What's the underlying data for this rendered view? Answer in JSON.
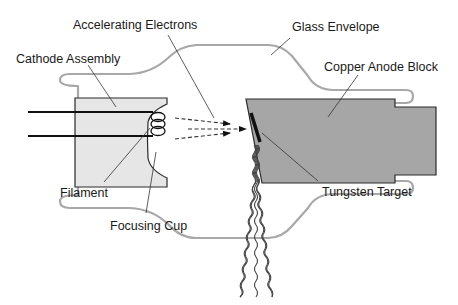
{
  "diagram": {
    "labels": {
      "accelerating_electrons": "Accelerating Electrons",
      "glass_envelope": "Glass Envelope",
      "cathode_assembly": "Cathode Assembly",
      "copper_anode_block": "Copper Anode Block",
      "filament": "Filament",
      "focusing_cup": "Focusing Cup",
      "tungsten_target": "Tungsten Target"
    },
    "colors": {
      "background": "#ffffff",
      "glass_envelope": "#a8a8a8",
      "cathode_fill": "#e6e6e6",
      "anode_fill": "#a6a6a6",
      "outline": "#2a2a2a",
      "target": "#111111",
      "leader_line": "#333333",
      "xray_wave": "#444444"
    }
  }
}
